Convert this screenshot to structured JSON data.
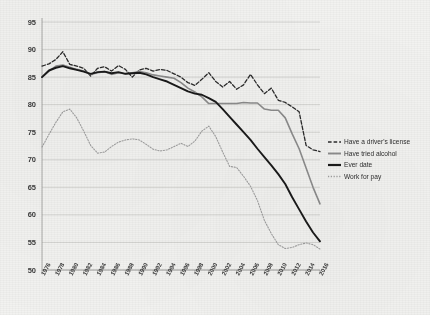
{
  "chart_data": {
    "type": "line",
    "title": "",
    "subtitle": "",
    "xlabel": "",
    "ylabel": "",
    "xlim": [
      1976,
      2016
    ],
    "ylim": [
      50,
      95
    ],
    "yticks": [
      50,
      55,
      60,
      65,
      70,
      75,
      80,
      85,
      90,
      95
    ],
    "grid": true,
    "legend_position": "right",
    "x": [
      1976,
      1977,
      1978,
      1979,
      1980,
      1981,
      1982,
      1983,
      1984,
      1985,
      1986,
      1987,
      1988,
      1989,
      1990,
      1991,
      1992,
      1993,
      1994,
      1995,
      1996,
      1997,
      1998,
      1999,
      2000,
      2001,
      2002,
      2003,
      2004,
      2005,
      2006,
      2007,
      2008,
      2009,
      2010,
      2011,
      2012,
      2013,
      2014,
      2015,
      2016
    ],
    "xtick_labels": [
      "1976",
      "1978",
      "1980",
      "1982",
      "1984",
      "1986",
      "1988",
      "1990",
      "1992",
      "1994",
      "1996",
      "1998",
      "2000",
      "2002",
      "2004",
      "2006",
      "2008",
      "2010",
      "2012",
      "2014",
      "2016"
    ],
    "series": [
      {
        "name": "Have a driver's license",
        "style": "dashed",
        "color": "#2b2b2b",
        "width": 1.3,
        "values": [
          87.0,
          87.4,
          88.2,
          89.6,
          87.3,
          87.0,
          86.6,
          85.2,
          86.6,
          86.9,
          86.1,
          87.1,
          86.4,
          85.0,
          86.3,
          86.6,
          86.1,
          86.4,
          86.2,
          85.6,
          85.0,
          84.0,
          83.5,
          84.6,
          85.8,
          84.2,
          83.2,
          84.2,
          82.8,
          83.6,
          85.5,
          83.6,
          82.0,
          83.0,
          80.8,
          80.4,
          79.6,
          78.7,
          72.6,
          71.8,
          71.5
        ]
      },
      {
        "name": "Have tried alcohol",
        "style": "solid",
        "color": "#8c8c8c",
        "width": 1.6,
        "values": [
          85.0,
          86.1,
          87.0,
          87.2,
          86.8,
          86.4,
          86.1,
          85.5,
          85.8,
          86.0,
          85.5,
          85.8,
          85.6,
          85.8,
          86.0,
          85.8,
          85.4,
          85.2,
          85.0,
          84.8,
          84.0,
          83.0,
          82.3,
          81.4,
          80.2,
          80.2,
          80.2,
          80.2,
          80.2,
          80.4,
          80.3,
          80.3,
          79.2,
          79.0,
          79.0,
          77.6,
          74.7,
          72.0,
          68.5,
          65.0,
          62.0
        ]
      },
      {
        "name": "Ever date",
        "style": "solid",
        "color": "#1a1a1a",
        "width": 1.9,
        "values": [
          85.0,
          86.2,
          86.7,
          87.0,
          86.6,
          86.3,
          86.0,
          85.6,
          85.9,
          86.0,
          85.7,
          85.9,
          85.6,
          85.7,
          85.8,
          85.5,
          85.0,
          84.6,
          84.2,
          83.6,
          83.0,
          82.4,
          82.0,
          81.8,
          81.2,
          80.5,
          79.2,
          77.8,
          76.4,
          75.0,
          73.6,
          72.0,
          70.5,
          69.0,
          67.4,
          65.6,
          63.2,
          61.0,
          58.8,
          56.8,
          55.2
        ]
      },
      {
        "name": "Work for pay",
        "style": "dotted",
        "color": "#9f9f9f",
        "width": 1.1,
        "values": [
          72.3,
          74.6,
          76.8,
          78.7,
          79.2,
          77.6,
          75.2,
          72.6,
          71.2,
          71.4,
          72.4,
          73.2,
          73.6,
          73.8,
          73.6,
          72.8,
          71.9,
          71.6,
          71.8,
          72.4,
          73.0,
          72.4,
          73.4,
          75.2,
          76.1,
          74.2,
          71.4,
          68.8,
          68.6,
          67.0,
          65.2,
          62.6,
          59.0,
          56.6,
          54.6,
          53.9,
          54.1,
          54.6,
          54.9,
          54.6,
          53.8
        ]
      }
    ]
  },
  "legend": {
    "items": [
      {
        "label": "Have a driver's license"
      },
      {
        "label": "Have tried alcohol"
      },
      {
        "label": "Ever date"
      },
      {
        "label": "Work for pay"
      }
    ]
  }
}
